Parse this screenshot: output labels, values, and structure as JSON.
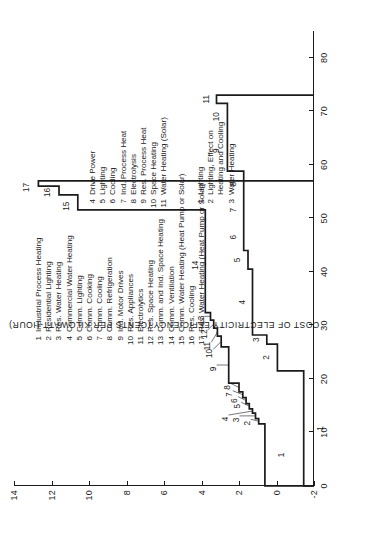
{
  "chart_data": {
    "type": "line",
    "subtype": "step / conservation-supply curve",
    "title": "",
    "xlabel": "",
    "ylabel": "COST OF ELECTRICITY EFFICIENCY (CENTS PER KILOWATT-HOUR)",
    "xlim": [
      0,
      85
    ],
    "ylim": [
      -2,
      14
    ],
    "xticks": [
      0,
      10,
      20,
      30,
      40,
      50,
      60,
      70,
      80
    ],
    "yticks": [
      -2,
      0,
      2,
      4,
      6,
      8,
      10,
      12,
      14
    ],
    "grid": false,
    "legend_position": "inside-upper-left",
    "series": [
      {
        "name": "Efficiency supply curve (17 measures)",
        "steps": [
          {
            "id": 1,
            "x_start": 0.0,
            "x_end": 11.6,
            "y": 0.62
          },
          {
            "id": 2,
            "x_start": 11.6,
            "x_end": 12.6,
            "y": 0.95
          },
          {
            "id": 3,
            "x_start": 12.6,
            "x_end": 13.6,
            "y": 1.12
          },
          {
            "id": 4,
            "x_start": 13.6,
            "x_end": 14.4,
            "y": 1.28
          },
          {
            "id": 5,
            "x_start": 14.4,
            "x_end": 15.4,
            "y": 1.45
          },
          {
            "id": 6,
            "x_start": 15.4,
            "x_end": 16.5,
            "y": 1.62
          },
          {
            "id": 7,
            "x_start": 16.5,
            "x_end": 17.6,
            "y": 1.8
          },
          {
            "id": 8,
            "x_start": 17.6,
            "x_end": 19.2,
            "y": 2.0
          },
          {
            "id": 9,
            "x_start": 19.2,
            "x_end": 26.0,
            "y": 2.55
          },
          {
            "id": 10,
            "x_start": 26.0,
            "x_end": 28.0,
            "y": 2.95
          },
          {
            "id": 11,
            "x_start": 28.0,
            "x_end": 29.5,
            "y": 3.15
          },
          {
            "id": 12,
            "x_start": 29.5,
            "x_end": 31.0,
            "y": 3.35
          },
          {
            "id": 13,
            "x_start": 31.0,
            "x_end": 32.4,
            "y": 3.52
          },
          {
            "id": 14,
            "x_start": 32.4,
            "x_end": 51.6,
            "y": 3.8
          },
          {
            "id": 15,
            "x_start": 51.6,
            "x_end": 54.4,
            "y": 10.6
          },
          {
            "id": 16,
            "x_start": 54.4,
            "x_end": 56.0,
            "y": 11.6
          },
          {
            "id": 17,
            "x_start": 56.0,
            "x_end": 57.0,
            "y": 12.7
          }
        ]
      },
      {
        "name": "Electricity supply / cost curve (11 measures)",
        "steps": [
          {
            "id": 1,
            "x_start": 0.0,
            "x_end": 21.5,
            "y": -1.45
          },
          {
            "id": 2,
            "x_start": 21.5,
            "x_end": 26.5,
            "y": -0.05
          },
          {
            "id": 3,
            "x_start": 26.5,
            "x_end": 28.2,
            "y": 0.52
          },
          {
            "id": 4,
            "x_start": 28.2,
            "x_end": 40.5,
            "y": 1.28
          },
          {
            "id": 5,
            "x_start": 40.5,
            "x_end": 44.0,
            "y": 1.52
          },
          {
            "id": 6,
            "x_start": 44.0,
            "x_end": 49.0,
            "y": 1.75
          },
          {
            "id": 7,
            "x_start": 49.0,
            "x_end": 54.0,
            "y": 1.75
          },
          {
            "id": 8,
            "x_start": 54.0,
            "x_end": 58.8,
            "y": 1.75
          },
          {
            "id": 9,
            "x_start": 58.8,
            "x_end": 66.5,
            "y": 2.62
          },
          {
            "id": 10,
            "x_start": 66.5,
            "x_end": 71.5,
            "y": 2.62
          },
          {
            "id": 11,
            "x_start": 71.5,
            "x_end": 73.0,
            "y": 3.2
          }
        ]
      }
    ],
    "point_labels_upper": [
      "1",
      "2",
      "3",
      "4",
      "5",
      "6",
      "7",
      "8",
      "9",
      "10",
      "11",
      "12",
      "13",
      "14",
      "15",
      "16",
      "17"
    ],
    "point_labels_lower": [
      "1",
      "2",
      "3",
      "4",
      "5",
      "6",
      "7",
      "8",
      "9",
      "10",
      "11"
    ]
  },
  "legend_main": {
    "items": [
      {
        "num": "1",
        "label": "Industrial Process Heating"
      },
      {
        "num": "2",
        "label": "Residential Lighting"
      },
      {
        "num": "3",
        "label": "Res. Water Heating"
      },
      {
        "num": "4",
        "label": "Commercial Water Heating"
      },
      {
        "num": "5",
        "label": "Comm. Lighting"
      },
      {
        "num": "6",
        "label": "Comm. Cooking"
      },
      {
        "num": "7",
        "label": "Comm. Cooling"
      },
      {
        "num": "8",
        "label": "Comm. Refrigeration"
      },
      {
        "num": "9",
        "label": "Ind. Motor Drives"
      },
      {
        "num": "10",
        "label": "Res. Appliances"
      },
      {
        "num": "11",
        "label": "Electrolytics"
      },
      {
        "num": "12",
        "label": "Res. Space Heating"
      },
      {
        "num": "13",
        "label": "Comm. and Ind. Space Heating"
      },
      {
        "num": "14",
        "label": "Comm. Ventilation"
      },
      {
        "num": "15",
        "label": "Comm. Water Heating (Heat Pump or Solar)"
      },
      {
        "num": "16",
        "label": "Res. Cooling"
      },
      {
        "num": "17",
        "label": "Res. Water Heating (Heat Pump or Solar)"
      }
    ]
  },
  "legend_lower_left": {
    "items": [
      {
        "num": "1",
        "label": "Lighting"
      },
      {
        "num": "2",
        "label": "Lighting, Effect on"
      },
      {
        "num": "",
        "label": "Heating and Cooling"
      },
      {
        "num": "3",
        "label": "Water Heating"
      }
    ]
  },
  "legend_lower_right": {
    "items": [
      {
        "num": "4",
        "label": "Drive Power"
      },
      {
        "num": "5",
        "label": "Lighting"
      },
      {
        "num": "6",
        "label": "Cooling"
      },
      {
        "num": "7",
        "label": "Ind. Process Heat"
      },
      {
        "num": "8",
        "label": "Electrolysis"
      },
      {
        "num": "9",
        "label": "Res. Process Heat"
      },
      {
        "num": "10",
        "label": "Space Heating"
      },
      {
        "num": "11",
        "label": "Water Heating (Solar)"
      }
    ]
  },
  "axes": {
    "y_title": "COST OF ELECTRICITY EFFICIENCY (CENTS PER KILOWATT-HOUR)",
    "x_ticks": [
      "0",
      "10",
      "20",
      "30",
      "40",
      "50",
      "60",
      "70",
      "80"
    ],
    "y_ticks": [
      "-2",
      "0",
      "2",
      "4",
      "6",
      "8",
      "10",
      "12",
      "14"
    ]
  }
}
